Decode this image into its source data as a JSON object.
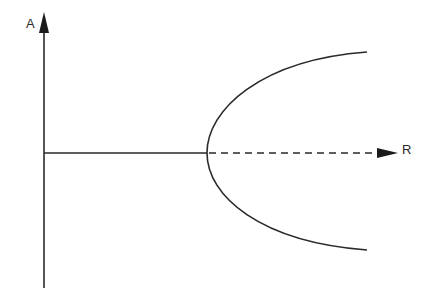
{
  "diagram": {
    "type": "pitchfork-bifurcation",
    "axes": {
      "vertical_label": "A",
      "horizontal_label": "R"
    },
    "branches": [
      {
        "name": "stable-trivial-branch",
        "style": "solid",
        "description": "A = 0 for R below bifurcation point"
      },
      {
        "name": "unstable-trivial-branch",
        "style": "dashed",
        "description": "A = 0 for R above bifurcation point"
      },
      {
        "name": "upper-parabolic-branch",
        "style": "solid"
      },
      {
        "name": "lower-parabolic-branch",
        "style": "solid"
      }
    ],
    "colors": {
      "stroke": "#2a2a2a",
      "background": "#ffffff"
    }
  }
}
